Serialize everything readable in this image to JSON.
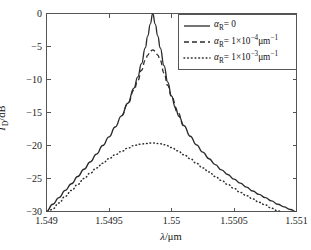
{
  "chart_data": {
    "type": "line",
    "title": "",
    "xlabel": "λ/μm",
    "ylabel": "T_D/dB",
    "xlabel_parts": {
      "symbol": "λ",
      "unit": "/μm"
    },
    "ylabel_parts": {
      "symbol": "T",
      "subscript": "D",
      "unit": "/dB"
    },
    "xlim": [
      1.549,
      1.551
    ],
    "ylim": [
      -30,
      0
    ],
    "grid": false,
    "legend_position": "upper-right",
    "xticks": [
      1.549,
      1.5495,
      1.55,
      1.5505,
      1.551
    ],
    "xtick_labels": [
      "1.549",
      "1.5495",
      "1.55",
      "1.5505",
      "1.551"
    ],
    "yticks": [
      0,
      -5,
      -10,
      -15,
      -20,
      -25,
      -30
    ],
    "ytick_labels": [
      "0",
      "−5",
      "−10",
      "−15",
      "−20",
      "−25",
      "−30"
    ],
    "resonance_center_um": 1.54985,
    "series": [
      {
        "name": "alpha_R = 0",
        "style": "solid",
        "color": "#2b2b2b",
        "peak_value_db": 0,
        "x": [
          1.549,
          1.54905,
          1.5491,
          1.54915,
          1.5492,
          1.54925,
          1.5493,
          1.54935,
          1.5494,
          1.54945,
          1.5495,
          1.54955,
          1.5496,
          1.54965,
          1.5497,
          1.54973,
          1.54976,
          1.54979,
          1.54981,
          1.54983,
          1.54985,
          1.54987,
          1.54989,
          1.54991,
          1.54994,
          1.54997,
          1.55,
          1.55003,
          1.55006,
          1.5501,
          1.55015,
          1.5502,
          1.55025,
          1.5503,
          1.55035,
          1.5504,
          1.55045,
          1.5505,
          1.55055,
          1.5506,
          1.55065,
          1.5507,
          1.55075,
          1.5508,
          1.55085,
          1.5509,
          1.55095,
          1.551
        ],
        "y": [
          -30.0,
          -28.9,
          -27.9,
          -26.8,
          -25.8,
          -24.7,
          -23.6,
          -22.5,
          -21.3,
          -20.0,
          -18.7,
          -17.2,
          -15.5,
          -13.6,
          -11.3,
          -9.6,
          -7.6,
          -5.2,
          -3.4,
          -1.6,
          0.0,
          -1.6,
          -3.4,
          -5.2,
          -7.9,
          -10.4,
          -12.5,
          -14.2,
          -15.6,
          -17.0,
          -18.6,
          -19.9,
          -21.0,
          -22.0,
          -22.9,
          -23.7,
          -24.4,
          -25.1,
          -25.7,
          -26.3,
          -26.9,
          -27.4,
          -27.9,
          -28.4,
          -28.9,
          -29.3,
          -29.7,
          -30.1
        ]
      },
      {
        "name": "alpha_R = 1×10^-4 μm^-1",
        "style": "dashed",
        "color": "#2b2b2b",
        "peak_value_db": -5.5,
        "x": [
          1.5496,
          1.54965,
          1.5497,
          1.54973,
          1.54976,
          1.54979,
          1.54981,
          1.54983,
          1.54985,
          1.54987,
          1.54989,
          1.54991,
          1.54994,
          1.54997,
          1.55,
          1.55005,
          1.5501
        ],
        "y": [
          -15.5,
          -13.7,
          -11.6,
          -10.2,
          -8.6,
          -7.1,
          -6.3,
          -5.7,
          -5.5,
          -5.7,
          -6.3,
          -7.1,
          -9.0,
          -10.9,
          -12.6,
          -15.0,
          -17.1
        ]
      },
      {
        "name": "alpha_R = 1×10^-3 μm^-1",
        "style": "dotted",
        "color": "#2b2b2b",
        "peak_value_db": -19.6,
        "x": [
          1.549,
          1.54905,
          1.5491,
          1.54915,
          1.5492,
          1.54925,
          1.5493,
          1.54935,
          1.5494,
          1.54945,
          1.5495,
          1.54955,
          1.5496,
          1.54965,
          1.5497,
          1.54975,
          1.5498,
          1.54985,
          1.5499,
          1.54995,
          1.55,
          1.55005,
          1.5501,
          1.55015,
          1.5502,
          1.55025,
          1.5503,
          1.55035,
          1.5504,
          1.55045,
          1.5505,
          1.55055,
          1.5506,
          1.55065,
          1.5507,
          1.55075,
          1.5508,
          1.55085,
          1.5509,
          1.55095,
          1.551
        ],
        "y": [
          -30.6,
          -29.6,
          -28.7,
          -27.7,
          -26.8,
          -25.9,
          -25.0,
          -24.2,
          -23.4,
          -22.7,
          -22.0,
          -21.4,
          -20.9,
          -20.4,
          -20.0,
          -19.8,
          -19.7,
          -19.6,
          -19.7,
          -19.9,
          -20.3,
          -20.8,
          -21.4,
          -22.0,
          -22.7,
          -23.4,
          -24.0,
          -24.7,
          -25.3,
          -25.9,
          -26.5,
          -27.1,
          -27.6,
          -28.1,
          -28.6,
          -29.0,
          -29.5,
          -29.9,
          -30.3,
          -30.7,
          -31.1
        ]
      }
    ]
  },
  "legend": {
    "entries": [
      {
        "symbol": "α",
        "subscript": "R",
        "equals": "=",
        "value": "0",
        "mantissa": "",
        "base": "",
        "exponent": "",
        "unit": "",
        "style": "solid"
      },
      {
        "symbol": "α",
        "subscript": "R",
        "equals": "=",
        "value": "",
        "mantissa": "1×10",
        "base": "",
        "exponent": "−4",
        "unit": "μm",
        "unit_exponent": "−1",
        "style": "dashed"
      },
      {
        "symbol": "α",
        "subscript": "R",
        "equals": "=",
        "value": "",
        "mantissa": "1×10",
        "base": "",
        "exponent": "−3",
        "unit": "μm",
        "unit_exponent": "−1",
        "style": "dotted"
      }
    ]
  },
  "colors": {
    "curve": "#2b2b2b",
    "axis": "#555555",
    "background": "#ffffff",
    "text": "#111111"
  }
}
